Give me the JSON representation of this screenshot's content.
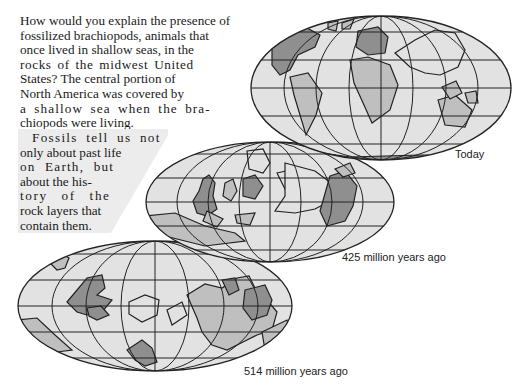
{
  "intro": {
    "lines": [
      "How would you explain the presence of",
      "fossilized brachiopods, animals that",
      "once lived in shallow seas, in the",
      "rocks of the midwest United",
      "States? The central portion of",
      "North America was covered by",
      "a shallow sea when the bra-",
      "chiopods were living."
    ]
  },
  "callout": {
    "lines": [
      "Fossils tell us not",
      "only about past life",
      "on Earth, but",
      "about the his-",
      "tory of the",
      "rock layers that",
      "contain them."
    ]
  },
  "maps": [
    {
      "id": "today",
      "caption": "Today"
    },
    {
      "id": "425mya",
      "caption": "425 million years ago"
    },
    {
      "id": "514mya",
      "caption": "514 million years ago"
    }
  ],
  "colors": {
    "ocean": "#e2e2e2",
    "land": "#bfbfbf",
    "land_dark": "#8f8f8f",
    "grid": "#222222",
    "callout_bg": "#ececec"
  }
}
